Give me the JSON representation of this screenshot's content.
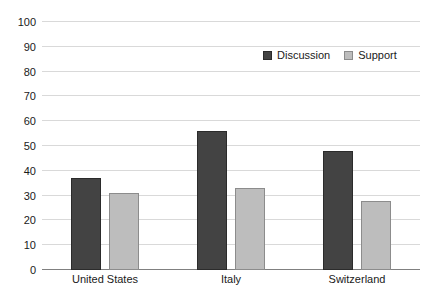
{
  "chart_data": {
    "type": "bar",
    "title": "",
    "xlabel": "",
    "ylabel": "",
    "ylim": [
      0,
      100
    ],
    "ytick_values": [
      0,
      10,
      20,
      30,
      40,
      50,
      60,
      70,
      80,
      90,
      100
    ],
    "ytick_labels": [
      "0",
      "10",
      "20",
      "30",
      "40",
      "50",
      "60",
      "70",
      "80",
      "90",
      "100"
    ],
    "categories": [
      "United States",
      "Italy",
      "Switzerland"
    ],
    "series": [
      {
        "name": "Discussion",
        "values": [
          37,
          56,
          48
        ],
        "color": "#434343"
      },
      {
        "name": "Support",
        "values": [
          31,
          33,
          28
        ],
        "color": "#bdbdbd"
      }
    ],
    "grid": true,
    "legend_position": "top-right"
  },
  "legend": {
    "items": [
      {
        "label": "Discussion",
        "swatch": "discussion-swatch"
      },
      {
        "label": "Support",
        "swatch": "support-swatch"
      }
    ]
  },
  "colors": {
    "discussion": "#434343",
    "discussion_border": "#2b2b2b",
    "support": "#bdbdbd",
    "support_border": "#8c8c8c",
    "gridline": "#d9d9d9",
    "axis": "#808080",
    "text": "#1a1a1a",
    "background": "#ffffff"
  }
}
